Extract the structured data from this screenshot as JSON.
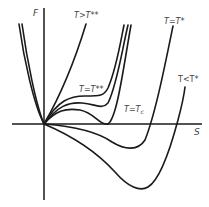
{
  "diagram": {
    "axes": {
      "y_label": "F",
      "x_label": "S"
    },
    "curves": [
      {
        "id": "T>T**",
        "label": "T>T**"
      },
      {
        "id": "T=T**",
        "label": "T=T**"
      },
      {
        "id": "T=Tc",
        "label": "T=Tc"
      },
      {
        "id": "T=T*",
        "label": "T=T*"
      },
      {
        "id": "T<T*",
        "label": "T<T*"
      }
    ],
    "labels": {
      "t_gt_tss": "T>T**",
      "t_eq_tss": "T=T**",
      "t_eq_tc": "T=T",
      "t_eq_tc_sub": "c",
      "t_eq_ts": "T=T*",
      "t_lt_ts": "T<T*"
    }
  }
}
